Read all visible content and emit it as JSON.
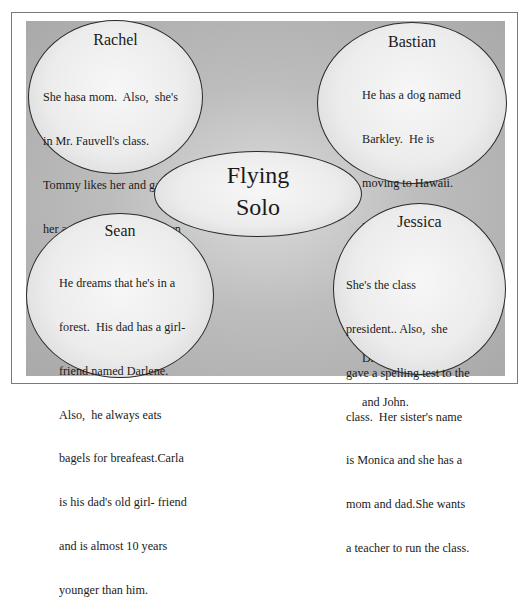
{
  "diagram": {
    "title_line1": "Flying",
    "title_line2": "Solo",
    "characters": [
      {
        "name": "Rachel",
        "lines": [
          "She hasa mom.  Also,  she's",
          "in Mr. Fauvell's class.",
          "Tommy likes her and gave",
          "her a pie.  She hasn't spoken",
          "for six  months."
        ]
      },
      {
        "name": "Bastian",
        "lines": [
          "He has a dog named",
          "Barkley.  He is",
          "moving to Hawaii.",
          "He's been to 8 air",
          "force bases. His best",
          "friends are Chad,",
          "Drew,Troy,Conner,",
          "and John."
        ]
      },
      {
        "name": "Sean",
        "lines": [
          "He dreams that he's in a",
          "forest.  His dad has a girl-",
          "friend named Darlene.",
          "Also,  he always eats",
          "bagels for breafeast.Carla",
          "is his dad's old girl- friend",
          "and is almost 10 years",
          "younger than him."
        ]
      },
      {
        "name": "Jessica",
        "lines": [
          "She's the class",
          "president.. Also,  she",
          "gave a spelling test to the",
          "class.  Her sister's name",
          "is Monica and she has a",
          "mom and dad.She wants",
          "a teacher to run the class."
        ]
      }
    ]
  }
}
